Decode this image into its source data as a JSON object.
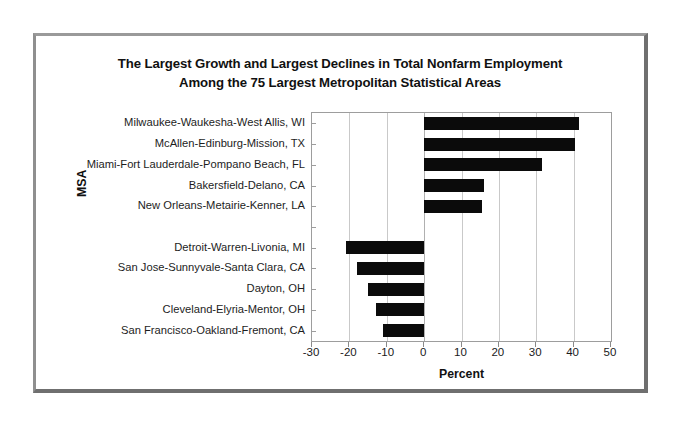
{
  "figure": {
    "title_line1": "The Largest Growth and Largest Declines in Total Nonfarm Employment",
    "title_line2": "Among the 75 Largest Metropolitan Statistical Areas",
    "frame_color": "#7a7a7a",
    "background": "#ffffff"
  },
  "chart_data": {
    "type": "bar",
    "orientation": "horizontal",
    "title": "The Largest Growth and Largest Declines in Total Nonfarm Employment Among the 75 Largest Metropolitan Statistical Areas",
    "xlabel": "Percent",
    "ylabel": "MSA",
    "xlim": [
      -30,
      50
    ],
    "xticks": [
      -30,
      -20,
      -10,
      0,
      10,
      20,
      30,
      40,
      50
    ],
    "xticklabels": [
      "-30",
      "-20",
      "-10",
      "0",
      "10",
      "20",
      "30",
      "40",
      "50"
    ],
    "grid": true,
    "grid_axis": "x",
    "legend": false,
    "bar_color": "#0b0b0b",
    "categories": [
      "Milwaukee-Waukesha-West Allis, WI",
      "McAllen-Edinburg-Mission, TX",
      "Miami-Fort Lauderdale-Pompano Beach, FL",
      "Bakersfield-Delano, CA",
      "New Orleans-Metairie-Kenner, LA",
      "",
      "Detroit-Warren-Livonia, MI",
      "San Jose-Sunnyvale-Santa Clara, CA",
      "Dayton, OH",
      "Cleveland-Elyria-Mentor, OH",
      "San Francisco-Oakland-Fremont, CA"
    ],
    "values": [
      41.5,
      40.5,
      31.5,
      16,
      15.5,
      null,
      -21,
      -18,
      -15,
      -13,
      -11
    ]
  }
}
